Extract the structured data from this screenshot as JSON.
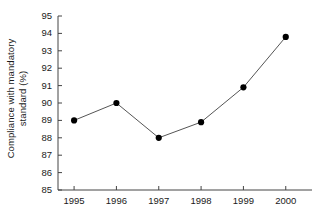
{
  "chart_data": {
    "type": "line",
    "title": "",
    "subtitle": "",
    "xlabel": "",
    "ylabel": "Compliance with mandatory standard (%)",
    "ylabel_line1": "Compliance with mandatory",
    "ylabel_line2": "standard (%)",
    "categories": [
      "1995",
      "1996",
      "1997",
      "1998",
      "1999",
      "2000"
    ],
    "x": [
      1995,
      1996,
      1997,
      1998,
      1999,
      2000
    ],
    "values": [
      89.0,
      90.0,
      88.0,
      88.9,
      90.9,
      93.8
    ],
    "series": [
      {
        "name": "Compliance with mandatory standard",
        "values": [
          89.0,
          90.0,
          88.0,
          88.9,
          90.9,
          93.8
        ]
      }
    ],
    "ylim": [
      85,
      95
    ],
    "yticks": [
      85,
      86,
      87,
      88,
      89,
      90,
      91,
      92,
      93,
      94,
      95
    ],
    "ytick_labels": [
      "85",
      "86",
      "87",
      "88",
      "89",
      "90",
      "91",
      "92",
      "93",
      "94",
      "95"
    ],
    "xticks": [
      1995,
      1996,
      1997,
      1998,
      1999,
      2000
    ],
    "xtick_labels": [
      "1995",
      "1996",
      "1997",
      "1998",
      "1999",
      "2000"
    ],
    "grid": false,
    "legend": false,
    "legend_position": "none",
    "marker": "filled-circle",
    "line_color": "#555555",
    "marker_color": "#000000",
    "axis_color": "#444444",
    "background_color": "#ffffff",
    "annotations": []
  }
}
